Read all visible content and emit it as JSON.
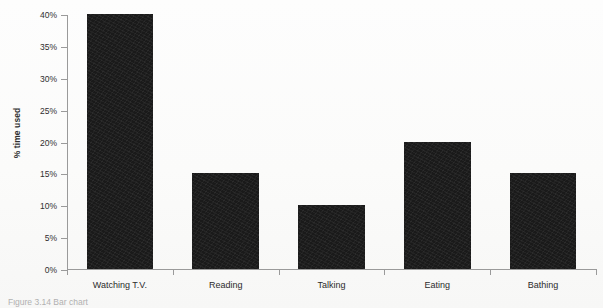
{
  "figure": {
    "y_axis_title": "% time used",
    "caption_clipped": "Figure 3.14  Bar chart",
    "axis_color": "#9a9a9a",
    "bar_color": "#1a1a1a",
    "text_color": "#2b2b2b",
    "background_color": "#ffffff"
  },
  "chart_data": {
    "type": "bar",
    "title": "",
    "subtitle": "",
    "xlabel": "",
    "ylabel": "% time used",
    "categories": [
      "Watching T.V.",
      "Reading",
      "Talking",
      "Eating",
      "Bathing"
    ],
    "values": [
      40,
      15,
      10,
      20,
      15
    ],
    "value_labels": [
      "40%",
      "15%",
      "10%",
      "20%",
      "15%"
    ],
    "ylim": [
      0,
      40
    ],
    "ytick_values": [
      0,
      5,
      10,
      15,
      20,
      25,
      30,
      35,
      40
    ],
    "ytick_labels": [
      "0%",
      "5%",
      "10%",
      "15%",
      "20%",
      "25%",
      "30%",
      "35%",
      "40%"
    ],
    "grid": false,
    "legend": false,
    "legend_position": "none",
    "orientation": "vertical",
    "series": [
      {
        "name": "% time used",
        "values": [
          40,
          15,
          10,
          20,
          15
        ],
        "color": "#1a1a1a"
      }
    ]
  }
}
